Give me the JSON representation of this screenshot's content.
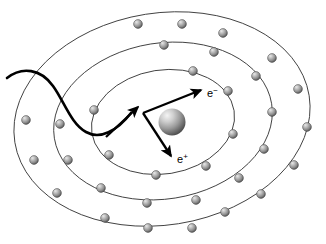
{
  "figure": {
    "background_color": "#ffffff",
    "width": 326,
    "height": 244
  },
  "nucleus": {
    "name": "nucleus",
    "cx": 172,
    "cy": 122,
    "r": 13.5,
    "color_light": "#f2f2f2",
    "color_mid": "#9a9a9a",
    "color_dark": "#4a4a4a"
  },
  "electron_sphere_style": {
    "r": 4.4,
    "color_light": "#e8e8e8",
    "color_mid": "#9d9d9d",
    "color_dark": "#4f4f4f",
    "outline": "#3a3a3a"
  },
  "orbits": [
    {
      "name": "inner-orbit",
      "cx": 163,
      "cy": 122,
      "rx": 72,
      "ry": 52,
      "rotation": -9,
      "stroke": "#3a3a3a",
      "electron_count": 7
    },
    {
      "name": "middle-orbit",
      "cx": 163,
      "cy": 121,
      "rx": 110,
      "ry": 78,
      "rotation": -9,
      "stroke": "#3a3a3a",
      "electron_count": 11
    },
    {
      "name": "outer-orbit",
      "cx": 162,
      "cy": 119,
      "rx": 149,
      "ry": 106,
      "rotation": -9,
      "stroke": "#3a3a3a",
      "electron_count": 15
    }
  ],
  "electrons": {
    "inner": [
      {
        "x": 193,
        "y": 71
      },
      {
        "x": 228,
        "y": 91
      },
      {
        "x": 233,
        "y": 134
      },
      {
        "x": 206,
        "y": 166
      },
      {
        "x": 156,
        "y": 175
      },
      {
        "x": 109,
        "y": 155
      },
      {
        "x": 94,
        "y": 110
      }
    ],
    "middle": [
      {
        "x": 164,
        "y": 45
      },
      {
        "x": 214,
        "y": 52
      },
      {
        "x": 256,
        "y": 76
      },
      {
        "x": 272,
        "y": 112
      },
      {
        "x": 264,
        "y": 149
      },
      {
        "x": 239,
        "y": 178
      },
      {
        "x": 196,
        "y": 200
      },
      {
        "x": 147,
        "y": 203
      },
      {
        "x": 101,
        "y": 188
      },
      {
        "x": 68,
        "y": 160
      },
      {
        "x": 60,
        "y": 124
      }
    ],
    "outer": [
      {
        "x": 138,
        "y": 24
      },
      {
        "x": 182,
        "y": 24
      },
      {
        "x": 223,
        "y": 33
      },
      {
        "x": 272,
        "y": 58
      },
      {
        "x": 298,
        "y": 89
      },
      {
        "x": 307,
        "y": 127
      },
      {
        "x": 294,
        "y": 165
      },
      {
        "x": 261,
        "y": 194
      },
      {
        "x": 225,
        "y": 212
      },
      {
        "x": 192,
        "y": 228
      },
      {
        "x": 148,
        "y": 228
      },
      {
        "x": 105,
        "y": 218
      },
      {
        "x": 57,
        "y": 193
      },
      {
        "x": 34,
        "y": 160
      },
      {
        "x": 26,
        "y": 120
      }
    ]
  },
  "incoming_particle": {
    "name": "incident-photon-trajectory",
    "description": "thick wavy trajectory entering from the left edge",
    "path": "M 7,78 C 22,68 40,70 52,86 C 64,102 72,124 86,132 C 100,140 116,132 131,113",
    "stroke": "#000000",
    "stroke_width": 2.6
  },
  "vectors": [
    {
      "name": "incident-arrow",
      "x1": 108,
      "y1": 135,
      "x2": 139,
      "y2": 108,
      "label": ""
    },
    {
      "name": "electron-arrow",
      "x1": 143,
      "y1": 112,
      "x2": 202,
      "y2": 90,
      "label": "e",
      "charge": "−"
    },
    {
      "name": "positron-arrow",
      "x1": 143,
      "y1": 112,
      "x2": 171,
      "y2": 155,
      "label": "e",
      "charge": "+"
    }
  ],
  "labels": {
    "electron": {
      "name": "electron-label",
      "base": "e",
      "superscript": "−",
      "x": 207,
      "y": 96
    },
    "positron": {
      "name": "positron-label",
      "base": "e",
      "superscript": "+",
      "x": 177,
      "y": 162
    }
  }
}
